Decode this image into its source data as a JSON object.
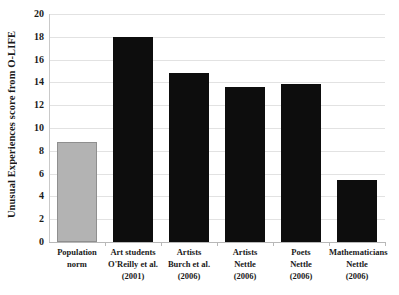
{
  "chart_data": {
    "type": "bar",
    "title": "",
    "xlabel": "",
    "ylabel": "Unusual Experiences score from O-LIFE",
    "ylim": [
      0,
      20
    ],
    "yticks": [
      0,
      2,
      4,
      6,
      8,
      10,
      12,
      14,
      16,
      18,
      20
    ],
    "grid": true,
    "legend": "none",
    "categories": [
      "Population norm",
      "Art students O'Reilly et al. (2001)",
      "Artists Burch et al. (2006)",
      "Artists Nettle (2006)",
      "Poets Nettle (2006)",
      "Mathematicians Nettle (2006)"
    ],
    "values": [
      8.8,
      18.0,
      14.8,
      13.6,
      13.9,
      5.4
    ],
    "bar_colors": [
      "#b3b3b3",
      "#0d0d0d",
      "#0d0d0d",
      "#0d0d0d",
      "#0d0d0d",
      "#0d0d0d"
    ]
  },
  "axis": {
    "y_title": "Unusual Experiences score from O-LIFE",
    "tick_labels": [
      "20",
      "18",
      "16",
      "14",
      "12",
      "10",
      "8",
      "6",
      "4",
      "2",
      "0"
    ]
  },
  "categories": [
    {
      "lines": [
        "Population",
        "norm"
      ]
    },
    {
      "lines": [
        "Art students",
        "O'Reilly et al.",
        "(2001)"
      ]
    },
    {
      "lines": [
        "Artists",
        "Burch et al.",
        "(2006)"
      ]
    },
    {
      "lines": [
        "Artists",
        "Nettle",
        "(2006)"
      ]
    },
    {
      "lines": [
        "Poets",
        "Nettle",
        "(2006)"
      ]
    },
    {
      "lines": [
        "Mathematicians",
        "Nettle",
        "(2006)"
      ]
    }
  ],
  "colors": {
    "population_bar": "#b3b3b3",
    "study_bar": "#0d0d0d",
    "gridline": "#e2e2e2",
    "axis": "#b8b8b8",
    "text": "#1a1a1a",
    "background": "#ffffff"
  }
}
